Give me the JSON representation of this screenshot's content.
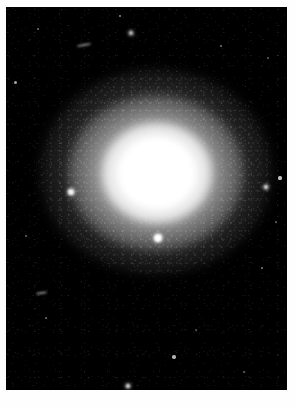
{
  "image": {
    "kind": "astronomical-photograph",
    "subject": "bright elliptical galaxy / globular cluster",
    "caption": "",
    "page_background": "#ffffff",
    "plate_background": "#000000",
    "plate": {
      "x": 6,
      "y": 7,
      "width": 281,
      "height": 383
    }
  },
  "galaxy": {
    "name": "central-galaxy",
    "center_x": 152,
    "center_y": 188,
    "core_color": "#ffffff",
    "halo_color": "#c8c8c8",
    "core_radius_px": 38,
    "halo_radius_x_px": 116,
    "halo_radius_y_px": 102,
    "position_angle_deg": 0
  },
  "sources": [
    {
      "name": "foreground-star-below-core",
      "x": 158,
      "y": 238,
      "r": 4.2,
      "brightness": 1.0,
      "style": "glow"
    },
    {
      "name": "field-star-left-bright",
      "x": 71,
      "y": 192,
      "r": 2.6,
      "brightness": 0.95,
      "style": "glow"
    },
    {
      "name": "field-star-right-mid",
      "x": 266,
      "y": 187,
      "r": 2.2,
      "brightness": 0.9,
      "style": "glow"
    },
    {
      "name": "field-star-right-upper",
      "x": 280,
      "y": 178,
      "r": 1.6,
      "brightness": 0.75,
      "style": "soft"
    },
    {
      "name": "field-star-bottom-center",
      "x": 128,
      "y": 386,
      "r": 2.4,
      "brightness": 0.92,
      "style": "glow"
    },
    {
      "name": "field-star-lower-right",
      "x": 174,
      "y": 357,
      "r": 1.8,
      "brightness": 0.7,
      "style": "soft"
    },
    {
      "name": "field-star-top-center",
      "x": 131,
      "y": 33,
      "r": 1.9,
      "brightness": 0.8,
      "style": "glow"
    },
    {
      "name": "field-star-top-left",
      "x": 120,
      "y": 16,
      "r": 1.2,
      "brightness": 0.55,
      "style": "soft"
    },
    {
      "name": "field-star-left-edge",
      "x": 15,
      "y": 82,
      "r": 1.5,
      "brightness": 0.65,
      "style": "soft"
    },
    {
      "name": "field-star-upper-left",
      "x": 38,
      "y": 29,
      "r": 1.0,
      "brightness": 0.45,
      "style": "soft"
    },
    {
      "name": "field-star-upper-right",
      "x": 221,
      "y": 46,
      "r": 1.1,
      "brightness": 0.48,
      "style": "soft"
    },
    {
      "name": "field-star-right-lower",
      "x": 262,
      "y": 268,
      "r": 1.2,
      "brightness": 0.5,
      "style": "soft"
    },
    {
      "name": "field-star-mid-left",
      "x": 26,
      "y": 236,
      "r": 1.0,
      "brightness": 0.42,
      "style": "soft"
    },
    {
      "name": "field-star-lower-left",
      "x": 46,
      "y": 318,
      "r": 1.1,
      "brightness": 0.44,
      "style": "soft"
    },
    {
      "name": "field-star-bottom-right",
      "x": 244,
      "y": 372,
      "r": 1.0,
      "brightness": 0.4,
      "style": "soft"
    },
    {
      "name": "field-star-right-far",
      "x": 276,
      "y": 222,
      "r": 1.0,
      "brightness": 0.4,
      "style": "soft"
    },
    {
      "name": "field-star-top-right-far",
      "x": 268,
      "y": 58,
      "r": 0.9,
      "brightness": 0.36,
      "style": "soft"
    },
    {
      "name": "field-star-bottom-mid",
      "x": 196,
      "y": 330,
      "r": 0.9,
      "brightness": 0.35,
      "style": "soft"
    }
  ],
  "streaks": [
    {
      "name": "elongated-object-upper-left",
      "x": 77,
      "y": 44,
      "width": 14,
      "height": 2,
      "angle": -10
    },
    {
      "name": "elongated-object-lower-left",
      "x": 36,
      "y": 292,
      "width": 11,
      "height": 2,
      "angle": -8
    }
  ]
}
